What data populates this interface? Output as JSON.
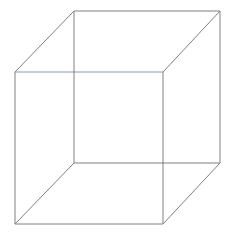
{
  "figure": {
    "kind": "line-drawing",
    "canvas": {
      "width": 234,
      "height": 232,
      "background_color": "#ffffff"
    },
    "style": {
      "stroke_color": "#808080",
      "stroke_width": 1,
      "accent_stroke_color": "#8c96b4",
      "accent_olive_color": "#9a9a6e",
      "fill": "none"
    },
    "vertices": {
      "front_top_left": {
        "label": "front-top-left",
        "x": 15,
        "y": 72
      },
      "front_top_right": {
        "label": "front-top-right",
        "x": 163,
        "y": 72
      },
      "front_bottom_right": {
        "label": "front-bottom-right",
        "x": 163,
        "y": 224
      },
      "front_bottom_left": {
        "label": "front-bottom-left",
        "x": 15,
        "y": 224
      },
      "back_top_left": {
        "label": "back-top-left",
        "x": 74,
        "y": 11
      },
      "back_top_right": {
        "label": "back-top-right",
        "x": 220,
        "y": 11
      },
      "back_bottom_right": {
        "label": "back-bottom-right",
        "x": 220,
        "y": 163
      },
      "back_bottom_left": {
        "label": "back-bottom-left",
        "x": 74,
        "y": 163
      }
    },
    "edges": [
      {
        "name": "front-top-edge",
        "group": "front-face",
        "points": "15,72 163,72",
        "color": "#8c96b4"
      },
      {
        "name": "front-right-edge",
        "group": "front-face",
        "points": "163,72 163,224",
        "color": "#808080"
      },
      {
        "name": "front-bottom-edge",
        "group": "front-face",
        "points": "163,224 15,224",
        "color": "#808080"
      },
      {
        "name": "front-left-edge",
        "group": "front-face",
        "points": "15,224 15,72",
        "color": "#808080"
      },
      {
        "name": "back-top-edge",
        "group": "back-face",
        "points": "74,11 220,11",
        "color": "#808080"
      },
      {
        "name": "back-right-edge",
        "group": "back-face",
        "points": "220,11 220,163",
        "color": "#808080"
      },
      {
        "name": "back-bottom-edge",
        "group": "back-face",
        "points": "220,163 74,163",
        "color": "#808080"
      },
      {
        "name": "back-left-edge",
        "group": "back-face",
        "points": "74,163 74,11",
        "color": "#808080"
      },
      {
        "name": "connector-top-left",
        "group": "depth",
        "points": "15,72 74,11",
        "color": "#808080"
      },
      {
        "name": "connector-top-right",
        "group": "depth",
        "points": "163,72 220,11",
        "color": "#808080"
      },
      {
        "name": "connector-bottom-right",
        "group": "depth",
        "points": "163,224 220,163",
        "color": "#808080"
      },
      {
        "name": "connector-bottom-left",
        "group": "depth",
        "points": "15,224 74,163",
        "color": "#808080"
      }
    ]
  }
}
